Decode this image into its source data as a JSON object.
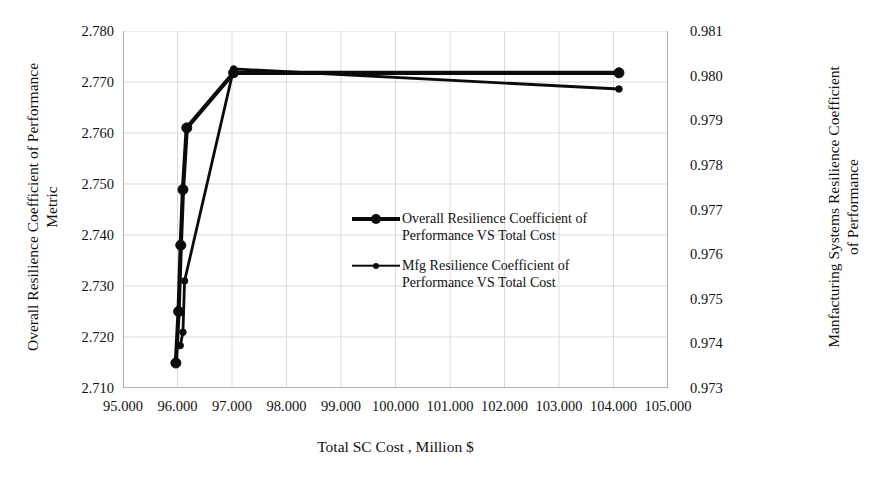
{
  "chart_data": {
    "type": "line",
    "title": "",
    "xlabel": "Total SC Cost , Million $",
    "ylabel": "Overall Resilience Coefficient of Performance Metric",
    "y2label": "Manfacturing Systems Resilience Coefficient of Performance",
    "xlim": [
      95.0,
      105.0
    ],
    "ylim": [
      2.71,
      2.78
    ],
    "y2lim": [
      0.973,
      0.981
    ],
    "grid": true,
    "legend_position": "center",
    "x_ticks": [
      "95.000",
      "96.000",
      "97.000",
      "98.000",
      "99.000",
      "100.000",
      "101.000",
      "102.000",
      "103.000",
      "104.000",
      "105.000"
    ],
    "y_ticks": [
      "2.780",
      "2.770",
      "2.760",
      "2.750",
      "2.740",
      "2.730",
      "2.720",
      "2.710"
    ],
    "y2_ticks": [
      "0.981",
      "0.980",
      "0.979",
      "0.978",
      "0.977",
      "0.976",
      "0.975",
      "0.974",
      "0.973"
    ],
    "series": [
      {
        "name": "Overall Resilience Coefficient of Performance VS Total Cost",
        "axis": "left",
        "color": "#0b0b0b",
        "line_width": 4.2,
        "marker_size": 10,
        "points": [
          {
            "x": 95.97,
            "y": 2.7149
          },
          {
            "x": 96.02,
            "y": 2.725
          },
          {
            "x": 96.06,
            "y": 2.738
          },
          {
            "x": 96.1,
            "y": 2.7489
          },
          {
            "x": 96.17,
            "y": 2.761
          },
          {
            "x": 97.03,
            "y": 2.7718
          },
          {
            "x": 104.1,
            "y": 2.7718
          }
        ]
      },
      {
        "name": "Mfg Resilience Coefficient of Performance VS Total Cost",
        "axis": "right",
        "color": "#0b0b0b",
        "line_width": 2.8,
        "marker_size": 6.5,
        "points": [
          {
            "x": 96.05,
            "y": 0.97395
          },
          {
            "x": 96.1,
            "y": 0.97425
          },
          {
            "x": 96.13,
            "y": 0.9754
          },
          {
            "x": 97.03,
            "y": 0.98015
          },
          {
            "x": 104.1,
            "y": 0.9797
          }
        ]
      }
    ],
    "legend": [
      {
        "label": "Overall Resilience Coefficient of\nPerformance VS Total Cost",
        "key": "thick-line-marker"
      },
      {
        "label": "Mfg Resilience Coefficient of\nPerformance VS Total Cost",
        "key": "thin-line-marker"
      }
    ]
  },
  "labels": {
    "y_left_line1": "Overall Resilience Coefficient of Performance",
    "y_left_line2": "Metric",
    "y_right_line1": "Manfacturing Systems Resilience Coefficient",
    "y_right_line2": "of Performance",
    "x_title": "Total SC Cost , Million $"
  },
  "colors": {
    "ink": "#0b0b0b",
    "grid": "#d9d9d9",
    "axis": "#b0b0b0",
    "background": "#ffffff"
  }
}
